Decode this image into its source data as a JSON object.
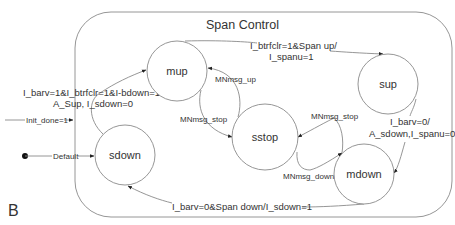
{
  "diagram": {
    "title": "Span Control",
    "figure_label": "B",
    "states": [
      {
        "id": "mup",
        "label": "mup"
      },
      {
        "id": "sup",
        "label": "sup"
      },
      {
        "id": "sstop",
        "label": "sstop"
      },
      {
        "id": "mdown",
        "label": "mdown"
      },
      {
        "id": "sdown",
        "label": "sdown"
      }
    ],
    "transitions": {
      "init": {
        "label": "Init_done=1"
      },
      "default": {
        "label": "Default"
      },
      "sdown_to_mup": {
        "line1": "I_barv=1&I_btrfclr=1&I-bdown=1/",
        "line2": "A_Sup, I_sdown=0"
      },
      "mup_to_sup": {
        "line1": "I_btrfclr=1&Span up/",
        "line2": "I_spanu=1"
      },
      "sup_to_mdown": {
        "line1": "I_barv=0/",
        "line2": "A_sdown,I_spanu=0"
      },
      "mdown_to_sdown": {
        "label": "I_barv=0&Span down/I_sdown=1"
      },
      "sstop_to_mup": {
        "label": "MNmsg_up"
      },
      "mup_to_sstop": {
        "label": "MNmsg_stop"
      },
      "mdown_to_sstop": {
        "label": "MNmsg_stop"
      },
      "sstop_to_mdown": {
        "label": "MNmsg_down"
      }
    },
    "colors": {
      "line": "#8a8a8a",
      "text": "#333333",
      "background": "#ffffff"
    }
  }
}
